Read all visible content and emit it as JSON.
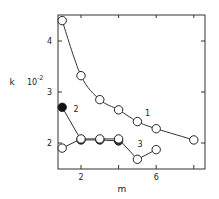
{
  "chart_data": {
    "type": "line",
    "title": "",
    "xlabel": "m",
    "ylabel": "k",
    "ylabel_multiplier": "10",
    "ylabel_exponent": "-2",
    "xlim": [
      0.8,
      9.2
    ],
    "ylim": [
      1.5,
      4.5
    ],
    "xticks": [
      2,
      4,
      6,
      8
    ],
    "xtick_labels": [
      "2",
      "",
      "6",
      ""
    ],
    "yticks": [
      2,
      3,
      4
    ],
    "ytick_labels": [
      "2",
      "3",
      "4"
    ],
    "grid": false,
    "legend": "inline curve labels",
    "series": [
      {
        "name": "1",
        "marker": "open-circle",
        "line": "smooth",
        "x": [
          1,
          2,
          3,
          4,
          5,
          6,
          8
        ],
        "y": [
          4.4,
          3.32,
          2.85,
          2.65,
          2.42,
          2.28,
          2.06
        ],
        "label_pos": [
          5.4,
          2.53
        ]
      },
      {
        "name": "2",
        "marker": "filled-circle",
        "line": "straight",
        "x": [
          1,
          2,
          3,
          4
        ],
        "y": [
          2.7,
          2.06,
          2.06,
          2.04
        ],
        "label_pos": [
          1.6,
          2.6
        ]
      },
      {
        "name": "3",
        "marker": "open-circle",
        "line": "straight",
        "x": [
          1,
          2,
          3,
          4,
          5,
          6
        ],
        "y": [
          1.9,
          2.08,
          2.08,
          2.08,
          1.68,
          1.87
        ],
        "label_pos": [
          5.0,
          1.93
        ]
      }
    ]
  }
}
